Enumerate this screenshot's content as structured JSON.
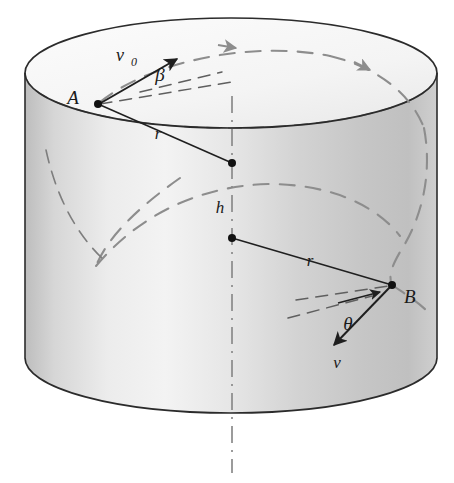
{
  "figure": {
    "kind": "physics-diagram",
    "background_color": "#ffffff",
    "outline_color": "#262626",
    "hidden_line_color": "#8a8a8a",
    "body_fill_light": "#f1f1f1",
    "body_fill_mid": "#d8d8d8",
    "body_fill_dark": "#b9b9b9",
    "top_face_fill": "#f7f7f7"
  },
  "labels": {
    "point_a": "A",
    "point_b": "B",
    "velocity_initial": "v",
    "velocity_initial_subscript": "0",
    "velocity_final": "v",
    "angle_beta": "β",
    "angle_theta": "θ",
    "radius_top": "r",
    "radius_bottom": "r",
    "height": "h"
  },
  "geometry": {
    "top_ellipse": {
      "cx": 231,
      "cy": 73,
      "rx": 206,
      "ry": 55
    },
    "bottom_ellipse": {
      "cx": 231,
      "cy": 358,
      "rx": 206,
      "ry": 55
    },
    "point_a": {
      "x": 98,
      "y": 104
    },
    "point_b": {
      "x": 392,
      "y": 285
    },
    "center_top": {
      "x": 232,
      "y": 163
    },
    "center_lower": {
      "x": 232,
      "y": 238
    },
    "axis_top": {
      "x": 232,
      "y": 96
    },
    "axis_bottom": {
      "x": 232,
      "y": 473
    },
    "v0_tip": {
      "x": 178,
      "y": 60
    },
    "v_tip": {
      "x": 333,
      "y": 346
    }
  },
  "label_positions": {
    "point_a": {
      "x": 73,
      "y": 104
    },
    "point_b": {
      "x": 402,
      "y": 300
    },
    "velocity_initial": {
      "x": 120,
      "y": 58
    },
    "velocity_initial_sub": {
      "x": 133,
      "y": 63
    },
    "angle_beta": {
      "x": 158,
      "y": 78
    },
    "angle_theta": {
      "x": 348,
      "y": 328
    },
    "radius_top": {
      "x": 156,
      "y": 137
    },
    "radius_bottom": {
      "x": 307,
      "y": 265
    },
    "height": {
      "x": 217,
      "y": 212
    },
    "velocity_final": {
      "x": 334,
      "y": 367
    }
  }
}
